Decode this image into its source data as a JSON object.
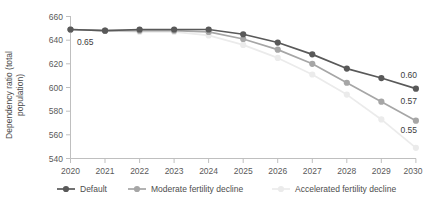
{
  "chart_data": {
    "type": "line",
    "title": "",
    "xlabel": "",
    "ylabel": "Dependency ratio (total population)",
    "x": [
      2020,
      2021,
      2022,
      2023,
      2024,
      2025,
      2026,
      2027,
      2028,
      2029,
      2030
    ],
    "xticklabels": [
      "2020",
      "2021",
      "2022",
      "2023",
      "2024",
      "2025",
      "2026",
      "2027",
      "2028",
      "2029",
      "2030"
    ],
    "yticklabels": [
      "540",
      "560",
      "580",
      "600",
      "620",
      "640",
      "660"
    ],
    "yticks": [
      540,
      560,
      580,
      600,
      620,
      640,
      660
    ],
    "ylim": [
      540,
      662
    ],
    "xlim": [
      2020,
      2030
    ],
    "grid": false,
    "legend_position": "bottom",
    "series": [
      {
        "name": "Default",
        "color": "#595959",
        "values": [
          649,
          648,
          649,
          649,
          649,
          645,
          638,
          628,
          616,
          608,
          599
        ]
      },
      {
        "name": "Moderate fertility decline",
        "color": "#a6a6a6",
        "values": [
          649,
          648,
          648,
          648,
          647,
          641,
          632,
          620,
          604,
          588,
          572
        ]
      },
      {
        "name": "Accelerated fertility decline",
        "color": "#ebebeb",
        "values": [
          649,
          648,
          647,
          647,
          644,
          636,
          625,
          611,
          594,
          573,
          549
        ]
      }
    ],
    "annotations": [
      {
        "text": "0.65",
        "series": "start",
        "x": 2020,
        "y": 640,
        "align": "start"
      },
      {
        "text": "0.60",
        "series": "Default",
        "x": 2030,
        "y": 599,
        "align": "end"
      },
      {
        "text": "0.57",
        "series": "Moderate fertility decline",
        "x": 2030,
        "y": 572,
        "align": "end"
      },
      {
        "text": "0.55",
        "series": "Accelerated fertility decline",
        "x": 2030,
        "y": 549,
        "align": "end"
      }
    ]
  },
  "axis": {
    "ylabel_line1": "Dependency ratio (total",
    "ylabel_line2": "population)"
  },
  "legend": {
    "items": [
      {
        "label": "Default",
        "color": "#595959"
      },
      {
        "label": "Moderate fertility decline",
        "color": "#a6a6a6"
      },
      {
        "label": "Accelerated fertility decline",
        "color": "#ebebeb"
      }
    ]
  },
  "ticks": {
    "y": [
      "660",
      "640",
      "620",
      "600",
      "580",
      "560",
      "540"
    ],
    "x": [
      "2020",
      "2021",
      "2022",
      "2023",
      "2024",
      "2025",
      "2026",
      "2027",
      "2028",
      "2029",
      "2030"
    ]
  },
  "labels": {
    "start_value": "0.65",
    "end_default": "0.60",
    "end_moderate": "0.57",
    "end_accelerated": "0.55"
  }
}
